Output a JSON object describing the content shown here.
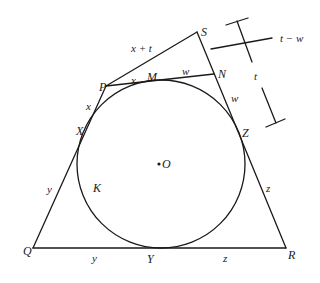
{
  "diagram": {
    "title": "",
    "colors": {
      "stroke": "#1a1a1a",
      "background": "#ffffff"
    },
    "points": {
      "P": "P",
      "S": "S",
      "N": "N",
      "M": "M",
      "X": "X",
      "Z": "Z",
      "Q": "Q",
      "R": "R",
      "Y": "Y",
      "O": "O",
      "K": "K"
    },
    "segment_labels": {
      "PS": "x + t",
      "PM": "x",
      "MN": "w",
      "NZ": "w",
      "PX": "x",
      "XQ": "y",
      "QY": "y",
      "YR": "z",
      "ZR": "z",
      "bracket_total": "t",
      "bracket_part": "t − w"
    }
  }
}
